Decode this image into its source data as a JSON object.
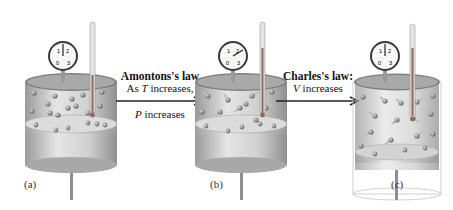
{
  "figure": {
    "panels": [
      {
        "id": "a",
        "label": "(a)",
        "gauge_reading": "1.5",
        "state": "initial"
      },
      {
        "id": "b",
        "label": "(b)",
        "gauge_reading": "2.5",
        "state": "higher temperature, higher pressure"
      },
      {
        "id": "c",
        "label": "(c)",
        "gauge_reading": "1.5",
        "state": "higher temperature, larger volume"
      }
    ],
    "gauge_ticks": [
      "0",
      "1",
      "2",
      "3"
    ],
    "transitions": [
      {
        "title": "Amontons's law",
        "line1_var": "T",
        "line1_prefix": "As ",
        "line1_suffix": " increases,",
        "line2_var": "P",
        "line2_suffix": " increases"
      },
      {
        "title": "Charles's law:",
        "line1_var": "V",
        "line1_suffix": " increases"
      }
    ]
  },
  "colors": {
    "cylinder": "#c9c9c9",
    "cylinder_dark": "#8a8a8a",
    "piston": "#d6d6d6",
    "molecule": "#7d7d7d",
    "thermometer_fill": "#8e6b5a",
    "arrow": "#222222"
  }
}
